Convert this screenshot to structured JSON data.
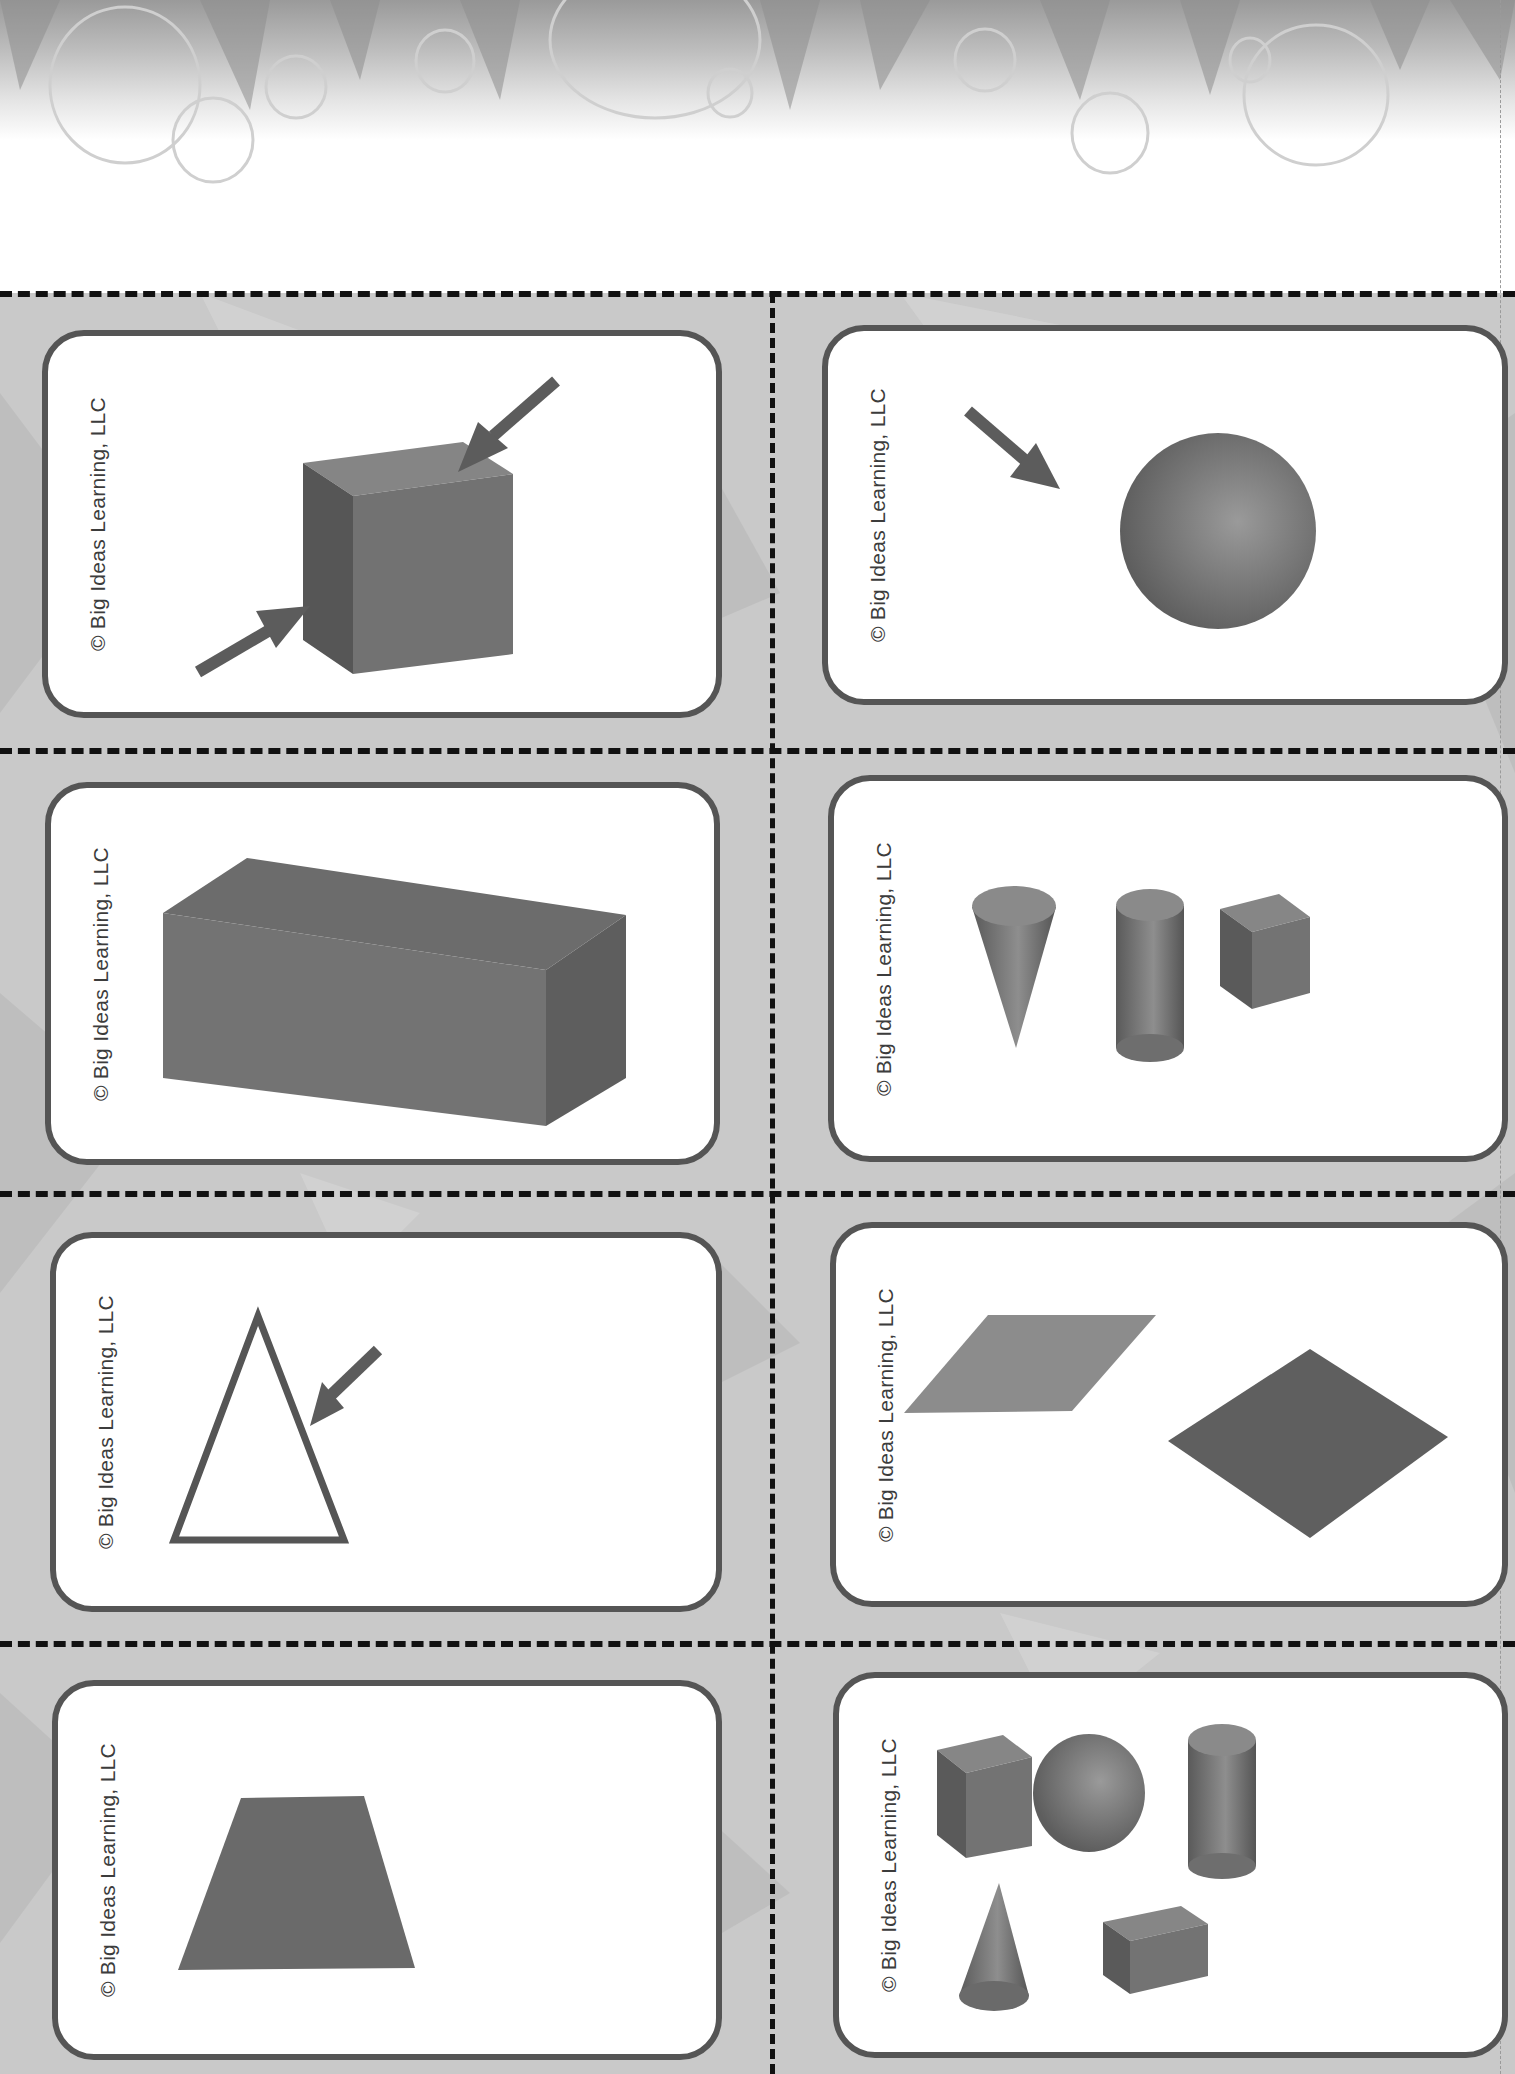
{
  "page": {
    "type": "printable cut-out vocabulary cards",
    "copyright": "© Big Ideas Learning, LLC"
  },
  "colors": {
    "card_border": "#555555",
    "shape_fill": "#6e6e6e",
    "shape_dark": "#555555",
    "shape_light": "#8a8a8a",
    "cut_line": "#111111",
    "sheet_background": "#c9c9c9"
  },
  "cards": [
    {
      "position": "row1-left",
      "copyright": "© Big Ideas Learning, LLC",
      "content": "cube with two arrows pointing to its vertices",
      "shapes": [
        "cube"
      ],
      "arrows": 2
    },
    {
      "position": "row1-right",
      "copyright": "© Big Ideas Learning, LLC",
      "content": "sphere with an arrow pointing to its surface",
      "shapes": [
        "sphere"
      ],
      "arrows": 1
    },
    {
      "position": "row2-left",
      "copyright": "© Big Ideas Learning, LLC",
      "content": "rectangular prism",
      "shapes": [
        "rectangular prism"
      ],
      "arrows": 0
    },
    {
      "position": "row2-right",
      "copyright": "© Big Ideas Learning, LLC",
      "content": "cone, cylinder and cube",
      "shapes": [
        "cone",
        "cylinder",
        "cube"
      ],
      "arrows": 0
    },
    {
      "position": "row3-left",
      "copyright": "© Big Ideas Learning, LLC",
      "content": "outlined triangle with an arrow pointing to a side",
      "shapes": [
        "triangle"
      ],
      "arrows": 1
    },
    {
      "position": "row3-right",
      "copyright": "© Big Ideas Learning, LLC",
      "content": "parallelogram and rhombus",
      "shapes": [
        "parallelogram",
        "rhombus"
      ],
      "arrows": 0
    },
    {
      "position": "row4-left",
      "copyright": "© Big Ideas Learning, LLC",
      "content": "trapezoid",
      "shapes": [
        "trapezoid"
      ],
      "arrows": 0
    },
    {
      "position": "row4-right",
      "copyright": "© Big Ideas Learning, LLC",
      "content": "cube, sphere, cylinder, cone and rectangular prism",
      "shapes": [
        "cube",
        "sphere",
        "cylinder",
        "cone",
        "rectangular prism"
      ],
      "arrows": 0
    }
  ]
}
